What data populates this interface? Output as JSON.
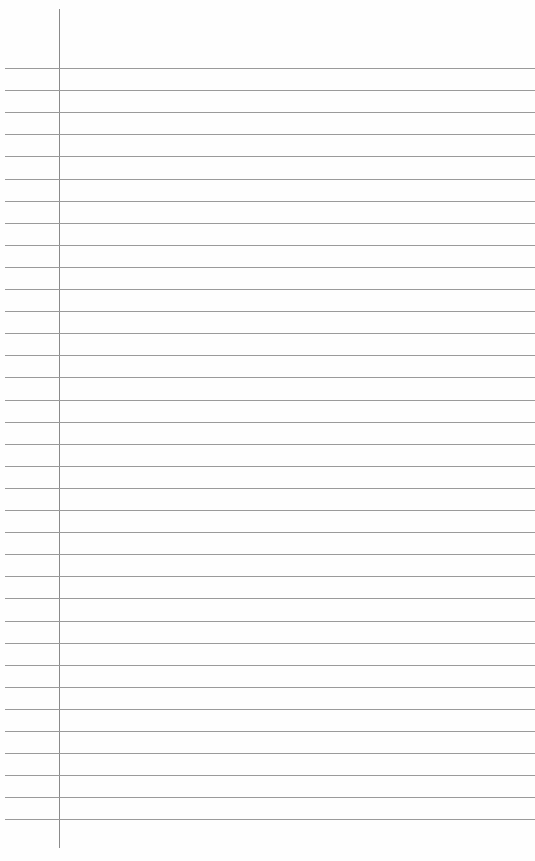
{
  "paper": {
    "type": "lined-notepaper",
    "background": "#fefefe",
    "rule_color": "#9a9a9a",
    "margin_color": "#8a8a8a",
    "margin_x": 59,
    "margin_top": 9,
    "margin_bottom": 848,
    "first_rule_y": 68,
    "rule_spacing": 22.1,
    "rule_count": 35
  }
}
